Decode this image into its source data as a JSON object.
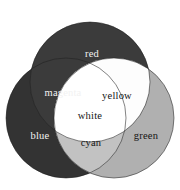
{
  "figure": {
    "name": "additive-color-venn-diagram",
    "background_color": "#ffffff",
    "width": 180,
    "height": 190
  },
  "chart_data": {
    "type": "venn",
    "title": "",
    "xlabel": "",
    "ylabel": "",
    "sets": [
      {
        "id": "red",
        "label": "red",
        "fill": "#3b3b3b",
        "text_color": "#f2f2f2",
        "cx": 90,
        "cy": 82,
        "r": 60,
        "label_x": 92,
        "label_y": 54
      },
      {
        "id": "blue",
        "label": "blue",
        "fill": "#333333",
        "text_color": "#f2f2f2",
        "cx": 66,
        "cy": 118,
        "r": 60,
        "label_x": 40,
        "label_y": 136
      },
      {
        "id": "green",
        "label": "green",
        "fill": "#b0b0b0",
        "text_color": "#141414",
        "cx": 114,
        "cy": 118,
        "r": 60,
        "label_x": 146,
        "label_y": 136
      }
    ],
    "intersections": [
      {
        "id": "magenta",
        "label": "magenta",
        "of": [
          "red",
          "blue"
        ],
        "fill": "#3b3b3b",
        "text_color": "#f2f2f2",
        "label_x": 63,
        "label_y": 93
      },
      {
        "id": "yellow",
        "label": "yellow",
        "of": [
          "red",
          "green"
        ],
        "fill": "#fdfdfd",
        "text_color": "#141414",
        "label_x": 117,
        "label_y": 96
      },
      {
        "id": "cyan",
        "label": "cyan",
        "of": [
          "blue",
          "green"
        ],
        "fill": "#c2c2c2",
        "text_color": "#141414",
        "label_x": 91,
        "label_y": 143
      },
      {
        "id": "white",
        "label": "white",
        "of": [
          "red",
          "green",
          "blue"
        ],
        "fill": "#ffffff",
        "text_color": "#141414",
        "label_x": 90,
        "label_y": 116
      }
    ],
    "legend": "none",
    "grid": false
  }
}
